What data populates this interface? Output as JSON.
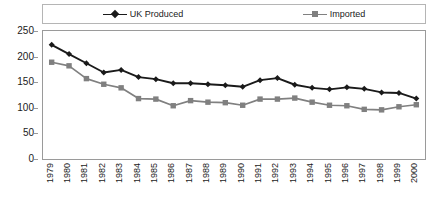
{
  "chart_data": {
    "type": "line",
    "title": "",
    "xlabel": "",
    "ylabel": "",
    "ylim": [
      0,
      250
    ],
    "yticks": [
      0,
      50,
      100,
      150,
      200,
      250
    ],
    "grid": false,
    "legend_position": "top",
    "categories": [
      "1979",
      "1980",
      "1981",
      "1982",
      "1983",
      "1984",
      "1985",
      "1986",
      "1987",
      "1988",
      "1989",
      "1990",
      "1991",
      "1992",
      "1993",
      "1994",
      "1995",
      "1996",
      "1997",
      "1998",
      "1999",
      "2000"
    ],
    "series": [
      {
        "name": "UK Produced",
        "color": "#1a1a1a",
        "marker": "diamond",
        "values": [
          223,
          205,
          187,
          169,
          174,
          160,
          156,
          148,
          148,
          146,
          144,
          141,
          154,
          158,
          145,
          139,
          136,
          140,
          137,
          130,
          129,
          118
        ]
      },
      {
        "name": "Imported",
        "color": "#808080",
        "marker": "square",
        "values": [
          189,
          182,
          157,
          146,
          139,
          118,
          117,
          104,
          114,
          111,
          110,
          105,
          117,
          117,
          119,
          111,
          105,
          104,
          97,
          96,
          102,
          106
        ]
      }
    ]
  },
  "legend": {
    "entries": [
      {
        "label": "UK Produced"
      },
      {
        "label": "Imported"
      }
    ]
  },
  "axis": {
    "y_tick_labels": [
      "250",
      "200",
      "150",
      "100",
      "50",
      "0"
    ],
    "x_tick_labels": [
      "1979",
      "1980",
      "1981",
      "1982",
      "1983",
      "1984",
      "1985",
      "1986",
      "1987",
      "1988",
      "1989",
      "1990",
      "1991",
      "1992",
      "1993",
      "1994",
      "1995",
      "1996",
      "1997",
      "1998",
      "1999",
      "2000"
    ]
  },
  "colors": {
    "uk_produced": "#1a1a1a",
    "imported": "#808080",
    "frame": "#9a9a9a",
    "background": "#ffffff"
  }
}
